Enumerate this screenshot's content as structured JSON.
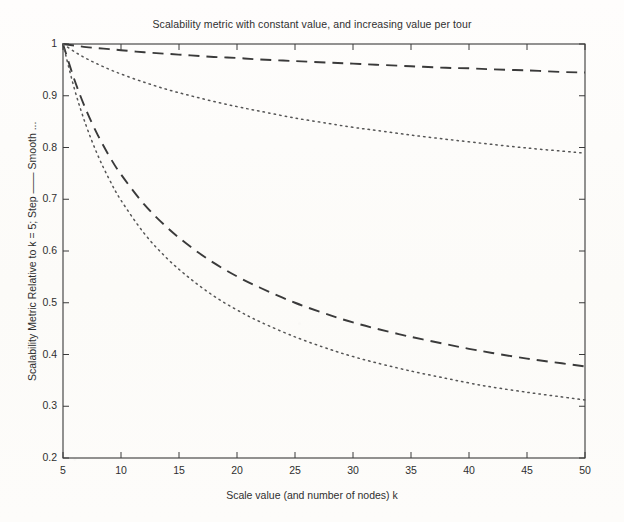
{
  "figure": {
    "width": 624,
    "height": 522,
    "background_color": "#fdfcfa",
    "ink_color": "#3a3a3a"
  },
  "chart_data": {
    "type": "line",
    "title": "Scalability metric with constant value, and increasing value per tour",
    "xlabel": "Scale value (and number of nodes) k",
    "ylabel": "Scalability Metric Relative to k = 5; Step —— Smooth ...",
    "xlim": [
      5,
      50
    ],
    "ylim": [
      0.2,
      1
    ],
    "xticks": [
      5,
      10,
      15,
      20,
      25,
      30,
      35,
      40,
      45,
      50
    ],
    "xticklabels": [
      "5",
      "10",
      "15",
      "20",
      "25",
      "30",
      "35",
      "40",
      "45",
      "50"
    ],
    "yticks": [
      0.2,
      0.3,
      0.4,
      0.5,
      0.6,
      0.7,
      0.8,
      0.9,
      1
    ],
    "yticklabels": [
      "0.2",
      "0.3",
      "0.4",
      "0.5",
      "0.6",
      "0.7",
      "0.8",
      "0.9",
      "1"
    ],
    "grid": false,
    "legend": "none",
    "x": [
      5,
      6,
      7,
      8,
      9,
      10,
      12,
      14,
      16,
      18,
      20,
      22,
      25,
      28,
      30,
      32,
      35,
      38,
      40,
      42,
      45,
      48,
      50
    ],
    "series": [
      {
        "name": "Increasing value per tour — Step",
        "linestyle": "dashed",
        "color": "#3a3a3a",
        "values": [
          1.0,
          0.997,
          0.994,
          0.992,
          0.99,
          0.988,
          0.984,
          0.981,
          0.978,
          0.975,
          0.973,
          0.97,
          0.967,
          0.964,
          0.962,
          0.96,
          0.957,
          0.954,
          0.953,
          0.951,
          0.949,
          0.946,
          0.945
        ]
      },
      {
        "name": "Increasing value per tour — Smooth",
        "linestyle": "dotted",
        "color": "#555555",
        "values": [
          1.0,
          0.985,
          0.972,
          0.961,
          0.951,
          0.942,
          0.926,
          0.912,
          0.9,
          0.889,
          0.879,
          0.87,
          0.857,
          0.846,
          0.839,
          0.833,
          0.824,
          0.816,
          0.811,
          0.806,
          0.799,
          0.793,
          0.789
        ]
      },
      {
        "name": "Constant value — Step",
        "linestyle": "dashed",
        "color": "#3a3a3a",
        "values": [
          1.0,
          0.93,
          0.872,
          0.824,
          0.783,
          0.748,
          0.69,
          0.645,
          0.608,
          0.577,
          0.551,
          0.529,
          0.5,
          0.476,
          0.462,
          0.45,
          0.434,
          0.42,
          0.411,
          0.403,
          0.392,
          0.383,
          0.377
        ]
      },
      {
        "name": "Constant value — Smooth",
        "linestyle": "dotted",
        "color": "#555555",
        "values": [
          1.0,
          0.912,
          0.842,
          0.785,
          0.738,
          0.698,
          0.634,
          0.585,
          0.546,
          0.513,
          0.486,
          0.463,
          0.434,
          0.41,
          0.396,
          0.384,
          0.368,
          0.354,
          0.345,
          0.337,
          0.327,
          0.318,
          0.312
        ]
      }
    ]
  }
}
